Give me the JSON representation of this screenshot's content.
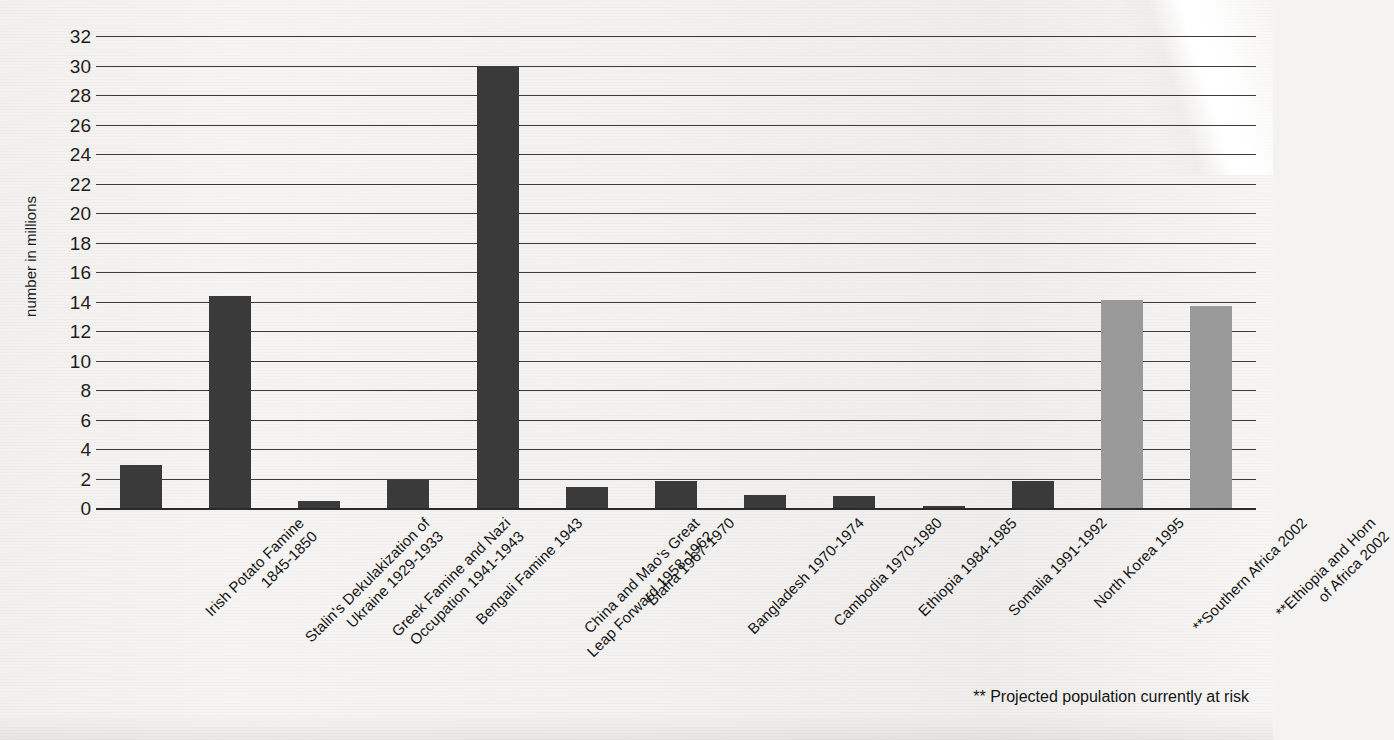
{
  "chart_data": {
    "type": "bar",
    "title": "",
    "xlabel": "",
    "ylabel": "number in millions",
    "ylim": [
      0,
      32
    ],
    "ytick_step": 2,
    "yticks": [
      32,
      30,
      28,
      26,
      24,
      22,
      20,
      18,
      16,
      14,
      12,
      10,
      8,
      6,
      4,
      2,
      0
    ],
    "grid": true,
    "legend": "none",
    "footnote": "**  Projected  population currently at risk",
    "categories": [
      "Irish Potato Famine\n1845-1850",
      "Stalin's Dekulakization of\nUkraine 1929-1933",
      "Greek Famine and Nazi\nOccupation 1941-1943",
      "Bengali Famine 1943",
      "China and Mao's Great\nLeap Forward 1958-1962",
      "Biafra 1967-1970",
      "Bangladesh 1970-1974",
      "Cambodia 1970-1980",
      "Ethiopia 1984-1985",
      "Somalia 1991-1992",
      "North Korea 1995",
      "**Southern Africa 2002",
      "**Ethiopia and Horn\nof Africa 2002"
    ],
    "values": [
      2.95,
      14.4,
      0.45,
      1.95,
      30.0,
      1.4,
      1.85,
      0.85,
      0.8,
      0.15,
      1.8,
      14.1,
      13.7
    ],
    "bar_colors": [
      "#3a3a3a",
      "#3a3a3a",
      "#3a3a3a",
      "#3a3a3a",
      "#3a3a3a",
      "#3a3a3a",
      "#3a3a3a",
      "#3a3a3a",
      "#3a3a3a",
      "#3a3a3a",
      "#3a3a3a",
      "#9a9a9a",
      "#9a9a9a"
    ],
    "colors": {
      "historic_bar": "#3a3a3a",
      "projected_bar": "#9a9a9a",
      "gridline": "#3b3b3b",
      "axis": "#2a2a2a",
      "background": "#f4f3f1",
      "text": "#141414"
    }
  }
}
